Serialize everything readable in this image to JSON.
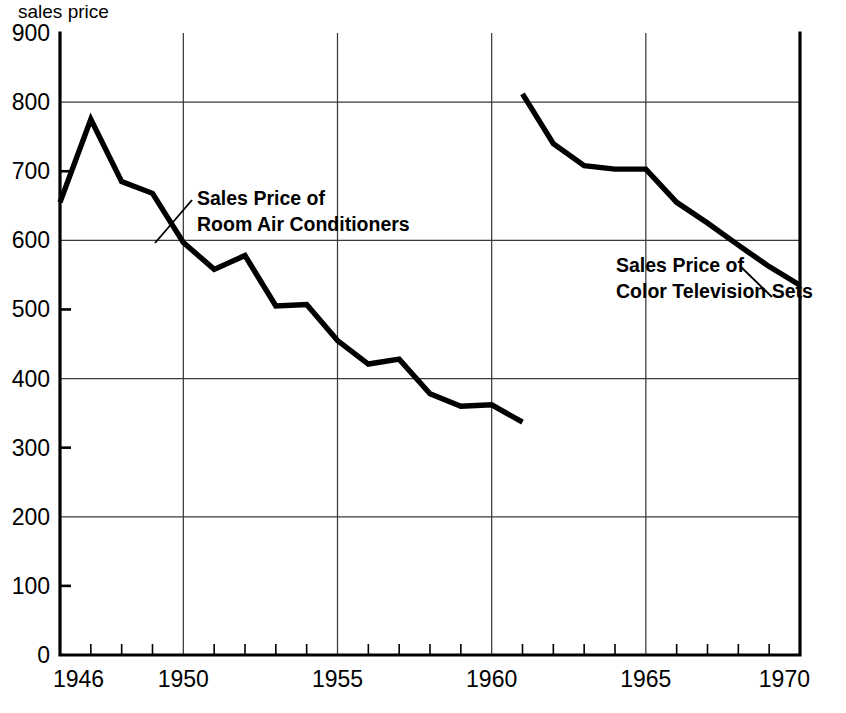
{
  "chart_data": {
    "type": "line",
    "title": "",
    "ylabel": "sales price",
    "xlabel": "",
    "ylim": [
      0,
      900
    ],
    "xlim": [
      1946,
      1970
    ],
    "grid": true,
    "grid_y_values": [
      200,
      400,
      600,
      800
    ],
    "grid_x_values": [
      1950,
      1955,
      1960,
      1965
    ],
    "y_ticks": [
      0,
      100,
      200,
      300,
      400,
      500,
      600,
      700,
      800,
      900
    ],
    "y_tick_labels": [
      "0",
      "100",
      "200",
      "300",
      "400",
      "500",
      "600",
      "700",
      "800",
      "900"
    ],
    "x_ticks": [
      1946,
      1950,
      1955,
      1960,
      1965,
      1970
    ],
    "x_tick_labels": [
      "1946",
      "1950",
      "1955",
      "1960",
      "1965",
      "1970"
    ],
    "x_minor_tick_step": 1,
    "legend_position": "inline-annotations",
    "series": [
      {
        "name": "Sales Price of Room Air Conditioners",
        "label_line1": "Sales Price of",
        "label_line2": "Room Air Conditioners",
        "color": "#000000",
        "x": [
          1946,
          1947,
          1948,
          1949,
          1950,
          1951,
          1952,
          1953,
          1954,
          1955,
          1956,
          1957,
          1958,
          1959,
          1960,
          1961
        ],
        "values": [
          655,
          775,
          685,
          668,
          597,
          558,
          578,
          505,
          507,
          455,
          421,
          428,
          378,
          360,
          362,
          337
        ]
      },
      {
        "name": "Sales Price of Color Television Sets",
        "label_line1": "Sales Price of",
        "label_line2": "Color Television Sets",
        "color": "#000000",
        "x": [
          1961,
          1962,
          1963,
          1964,
          1965,
          1966,
          1967,
          1968,
          1969,
          1970
        ],
        "values": [
          812,
          740,
          708,
          703,
          703,
          655,
          625,
          593,
          562,
          535
        ]
      }
    ],
    "annotations": [
      {
        "name": "room-air-conditioners-annotation",
        "line1": "Sales Price of",
        "line2": "Room Air Conditioners",
        "text_x": 197,
        "text_y": 205,
        "leader_from_x": 192,
        "leader_from_y": 200,
        "leader_to_x": 155,
        "leader_to_y": 243
      },
      {
        "name": "color-television-sets-annotation",
        "line1": "Sales Price of",
        "line2": "Color Television Sets",
        "text_x": 616,
        "text_y": 272,
        "leader_from_x": 740,
        "leader_from_y": 266,
        "leader_to_x": 772,
        "leader_to_y": 297
      }
    ]
  },
  "plot_geometry": {
    "left": 60,
    "right": 800,
    "top": 33,
    "bottom": 655
  }
}
